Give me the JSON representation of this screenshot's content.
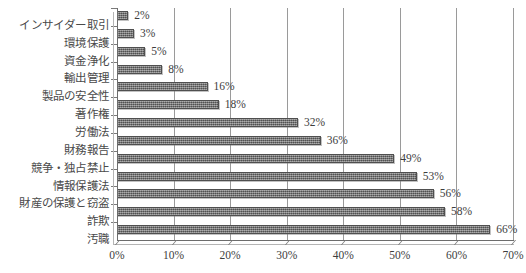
{
  "chart_data": {
    "type": "bar",
    "orientation": "horizontal",
    "title": "",
    "subtitle": "",
    "xlabel": "",
    "ylabel": "",
    "xlim": [
      0,
      70
    ],
    "grid": true,
    "legend": false,
    "legend_position": "none",
    "bar_color": "#6b6b6b",
    "bar_edge_color": "#4f4f4f",
    "text_color": "#3d3d3d",
    "gridline_color": "#9a9a9a",
    "axis_color": "#6d6d6d",
    "categories": [
      "インサイダー取引",
      "環境保護",
      "資金浄化",
      "輸出管理",
      "製品の安全性",
      "著作権",
      "労働法",
      "財務報告",
      "競争・独占禁止",
      "情報保護法",
      "財産の保護と窃盗",
      "詐欺",
      "汚職"
    ],
    "values": [
      2,
      3,
      5,
      8,
      16,
      18,
      32,
      36,
      49,
      53,
      56,
      58,
      66
    ],
    "data_labels": [
      "2%",
      "3%",
      "5%",
      "8%",
      "16%",
      "18%",
      "32%",
      "36%",
      "49%",
      "53%",
      "56%",
      "58%",
      "66%"
    ],
    "x_ticks": [
      0,
      10,
      20,
      30,
      40,
      50,
      60,
      70
    ],
    "x_tick_labels": [
      "0%",
      "10%",
      "20%",
      "30%",
      "40%",
      "50%",
      "60%",
      "70%"
    ]
  }
}
